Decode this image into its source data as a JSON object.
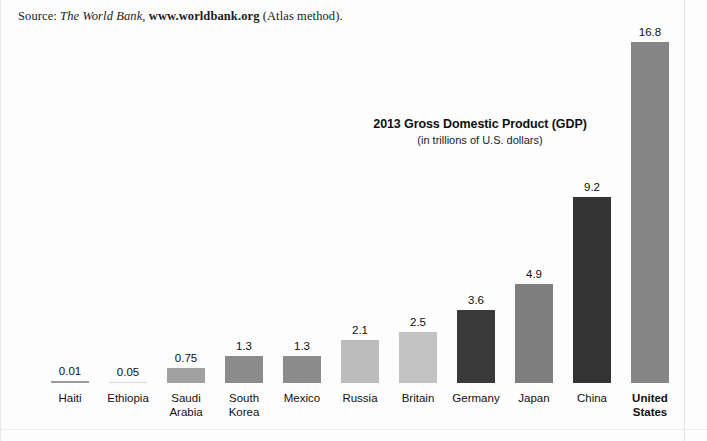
{
  "source": {
    "prefix": "Source: ",
    "publisher": "The World Bank",
    "separator": ", ",
    "url": "www.worldbank.org",
    "suffix": " (Atlas method)."
  },
  "title": "2013 Gross Domestic Product (GDP)",
  "subtitle": "(in trillions of U.S. dollars)",
  "chart_data": {
    "type": "bar",
    "title": "2013 Gross Domestic Product (GDP)",
    "subtitle": "(in trillions of U.S. dollars)",
    "xlabel": "",
    "ylabel": "GDP (trillions of U.S. dollars)",
    "ylim": [
      0,
      16.8
    ],
    "grid": false,
    "legend": false,
    "value_labels": true,
    "source_note": "Source: The World Bank, www.worldbank.org (Atlas method).",
    "categories": [
      "Haiti",
      "Ethiopia",
      "Saudi Arabia",
      "South Korea",
      "Mexico",
      "Russia",
      "Britain",
      "Germany",
      "Japan",
      "China",
      "United States"
    ],
    "values": [
      0.01,
      0.05,
      0.75,
      1.3,
      1.3,
      2.1,
      2.5,
      3.6,
      4.9,
      9.2,
      16.8
    ],
    "value_label_text": [
      "0.01",
      "0.05",
      "0.75",
      "1.3",
      "1.3",
      "2.1",
      "2.5",
      "3.6",
      "4.9",
      "9.2",
      "16.8"
    ],
    "bar_colors": [
      "#9a9a9a",
      "#c8c8c8",
      "#a0a0a0",
      "#8b8b8b",
      "#8b8b8b",
      "#bcbcbc",
      "#c2c2c2",
      "#3a3a3a",
      "#7e7e7e",
      "#333333",
      "#858585"
    ]
  },
  "bars": [
    {
      "label": "Haiti",
      "value_label": "0.01",
      "color": "#9a9a9a",
      "x": 50,
      "width": 38,
      "height": 2,
      "bold_label": false
    },
    {
      "label": "Ethiopia",
      "value_label": "0.05",
      "color": "#d8d8d8",
      "x": 108,
      "width": 38,
      "height": 1,
      "bold_label": false
    },
    {
      "label": "Saudi\nArabia",
      "value_label": "0.75",
      "color": "#a0a0a0",
      "x": 166,
      "width": 38,
      "height": 15,
      "bold_label": false
    },
    {
      "label": "South\nKorea",
      "value_label": "1.3",
      "color": "#8b8b8b",
      "x": 224,
      "width": 38,
      "height": 27,
      "bold_label": false
    },
    {
      "label": "Mexico",
      "value_label": "1.3",
      "color": "#8b8b8b",
      "x": 282,
      "width": 38,
      "height": 27,
      "bold_label": false
    },
    {
      "label": "Russia",
      "value_label": "2.1",
      "color": "#bcbcbc",
      "x": 340,
      "width": 38,
      "height": 43,
      "bold_label": false
    },
    {
      "label": "Britain",
      "value_label": "2.5",
      "color": "#c2c2c2",
      "x": 398,
      "width": 38,
      "height": 51,
      "bold_label": false
    },
    {
      "label": "Germany",
      "value_label": "3.6",
      "color": "#3a3a3a",
      "x": 456,
      "width": 38,
      "height": 73,
      "bold_label": false
    },
    {
      "label": "Japan",
      "value_label": "4.9",
      "color": "#7e7e7e",
      "x": 514,
      "width": 38,
      "height": 99,
      "bold_label": false
    },
    {
      "label": "China",
      "value_label": "9.2",
      "color": "#333333",
      "x": 572,
      "width": 38,
      "height": 186,
      "bold_label": false
    },
    {
      "label": "United\nStates",
      "value_label": "16.8",
      "color": "#858585",
      "x": 630,
      "width": 38,
      "height": 341,
      "bold_label": true
    }
  ]
}
